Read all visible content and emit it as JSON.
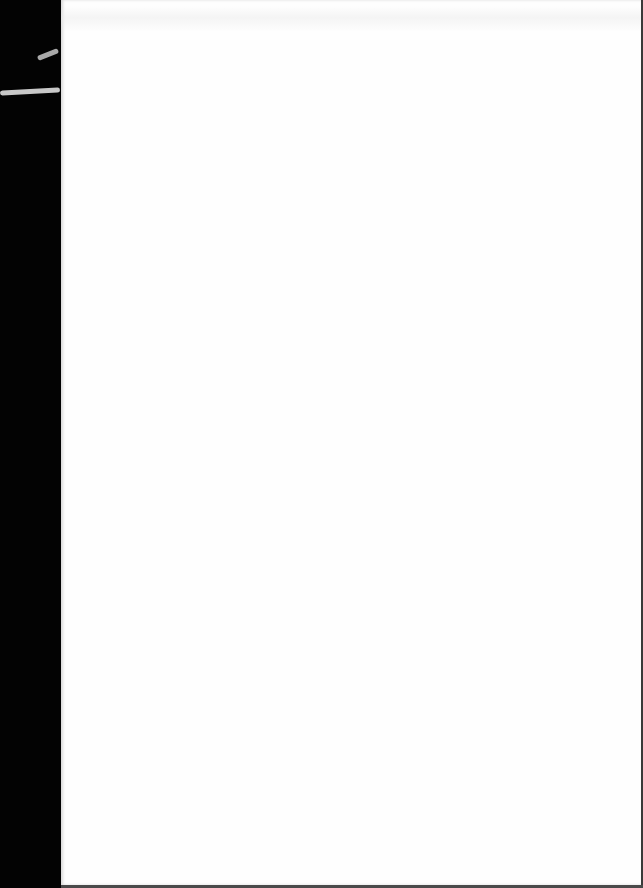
{
  "document": {
    "type": "scanned-page",
    "content_text": "",
    "page_color": "#fefefe",
    "binding_edge_color": "#030303",
    "edge_line_color": "#3a3a3a"
  }
}
